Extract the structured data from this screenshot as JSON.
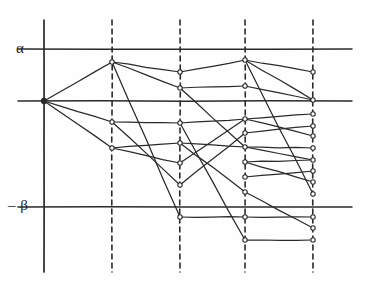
{
  "figure": {
    "kind": "hand-drawn-lattice-diagram",
    "background": "#fefefe",
    "ink_color": "#2a2a2a",
    "width": 368,
    "height": 283
  },
  "axis_labels": {
    "upper": "α",
    "lower": "– β"
  },
  "chart_data": {
    "type": "line",
    "title": "",
    "xlabel": "",
    "ylabel": "",
    "grid": true,
    "legend": "none",
    "xlim": [
      0,
      5
    ],
    "ylim": [
      -2.1,
      1.35
    ],
    "x": [
      0,
      1,
      2,
      3,
      4
    ],
    "x_pixels": [
      44,
      112,
      180,
      245,
      313
    ],
    "reference_lines": [
      {
        "name": "alpha",
        "label": "α",
        "value": 1.0,
        "y_pixel": 49,
        "style": "solid"
      },
      {
        "name": "zero",
        "label": "",
        "value": 0.0,
        "y_pixel": 101,
        "style": "solid"
      },
      {
        "name": "minus-beta",
        "label": "– β",
        "value": -1.0,
        "y_pixel": 207,
        "style": "solid"
      }
    ],
    "vertical_lines": [
      {
        "name": "value-axis",
        "x_pixel": 44,
        "style": "solid",
        "y_from": 20,
        "y_to": 272
      },
      {
        "name": "stage-1",
        "x_pixel": 112,
        "style": "dashed",
        "y_from": 20,
        "y_to": 272
      },
      {
        "name": "stage-2",
        "x_pixel": 180,
        "style": "dashed",
        "y_from": 20,
        "y_to": 272
      },
      {
        "name": "stage-3",
        "x_pixel": 245,
        "style": "dashed",
        "y_from": 20,
        "y_to": 272
      },
      {
        "name": "stage-4",
        "x_pixel": 313,
        "style": "dashed",
        "y_from": 20,
        "y_to": 272
      }
    ],
    "nodes": [
      {
        "id": "r",
        "col": 0,
        "x": 44,
        "y": 101,
        "marker": "filled"
      },
      {
        "id": "a0",
        "col": 1,
        "x": 112,
        "y": 62,
        "marker": "open"
      },
      {
        "id": "a1",
        "col": 1,
        "x": 112,
        "y": 122,
        "marker": "open"
      },
      {
        "id": "a2",
        "col": 1,
        "x": 112,
        "y": 148,
        "marker": "open"
      },
      {
        "id": "b0",
        "col": 2,
        "x": 180,
        "y": 72,
        "marker": "open"
      },
      {
        "id": "b1",
        "col": 2,
        "x": 180,
        "y": 88,
        "marker": "open"
      },
      {
        "id": "b2",
        "col": 2,
        "x": 180,
        "y": 123,
        "marker": "open"
      },
      {
        "id": "b3",
        "col": 2,
        "x": 180,
        "y": 143,
        "marker": "open"
      },
      {
        "id": "b4",
        "col": 2,
        "x": 180,
        "y": 163,
        "marker": "open"
      },
      {
        "id": "b5",
        "col": 2,
        "x": 180,
        "y": 185,
        "marker": "open"
      },
      {
        "id": "b6",
        "col": 2,
        "x": 180,
        "y": 217,
        "marker": "open"
      },
      {
        "id": "c0",
        "col": 3,
        "x": 245,
        "y": 60,
        "marker": "open"
      },
      {
        "id": "c1",
        "col": 3,
        "x": 245,
        "y": 86,
        "marker": "open"
      },
      {
        "id": "c2",
        "col": 3,
        "x": 245,
        "y": 119,
        "marker": "open"
      },
      {
        "id": "c3",
        "col": 3,
        "x": 245,
        "y": 133,
        "marker": "open"
      },
      {
        "id": "c4",
        "col": 3,
        "x": 245,
        "y": 147,
        "marker": "open"
      },
      {
        "id": "c5",
        "col": 3,
        "x": 245,
        "y": 162,
        "marker": "open"
      },
      {
        "id": "c6",
        "col": 3,
        "x": 245,
        "y": 177,
        "marker": "open"
      },
      {
        "id": "c7",
        "col": 3,
        "x": 245,
        "y": 192,
        "marker": "open"
      },
      {
        "id": "c8",
        "col": 3,
        "x": 245,
        "y": 217,
        "marker": "open"
      },
      {
        "id": "c9",
        "col": 3,
        "x": 245,
        "y": 240,
        "marker": "open"
      },
      {
        "id": "d0",
        "col": 4,
        "x": 313,
        "y": 72,
        "marker": "open"
      },
      {
        "id": "d1",
        "col": 4,
        "x": 313,
        "y": 100,
        "marker": "open"
      },
      {
        "id": "d2",
        "col": 4,
        "x": 313,
        "y": 114,
        "marker": "open"
      },
      {
        "id": "d3",
        "col": 4,
        "x": 313,
        "y": 126,
        "marker": "open"
      },
      {
        "id": "d4",
        "col": 4,
        "x": 313,
        "y": 136,
        "marker": "open"
      },
      {
        "id": "d5",
        "col": 4,
        "x": 313,
        "y": 148,
        "marker": "open"
      },
      {
        "id": "d6",
        "col": 4,
        "x": 313,
        "y": 160,
        "marker": "open"
      },
      {
        "id": "d7",
        "col": 4,
        "x": 313,
        "y": 171,
        "marker": "open"
      },
      {
        "id": "d8",
        "col": 4,
        "x": 313,
        "y": 182,
        "marker": "open"
      },
      {
        "id": "d9",
        "col": 4,
        "x": 313,
        "y": 194,
        "marker": "open"
      },
      {
        "id": "d10",
        "col": 4,
        "x": 313,
        "y": 217,
        "marker": "open"
      },
      {
        "id": "d11",
        "col": 4,
        "x": 313,
        "y": 228,
        "marker": "open"
      },
      {
        "id": "d12",
        "col": 4,
        "x": 313,
        "y": 240,
        "marker": "open"
      }
    ],
    "edges": [
      [
        "r",
        "a0"
      ],
      [
        "r",
        "a1"
      ],
      [
        "r",
        "a2"
      ],
      [
        "a0",
        "b0"
      ],
      [
        "a0",
        "b1"
      ],
      [
        "a0",
        "b6"
      ],
      [
        "a1",
        "b2"
      ],
      [
        "a1",
        "b5"
      ],
      [
        "a2",
        "b3"
      ],
      [
        "a2",
        "b4"
      ],
      [
        "b0",
        "c0"
      ],
      [
        "b1",
        "c1"
      ],
      [
        "b1",
        "c4"
      ],
      [
        "b2",
        "c2"
      ],
      [
        "b2",
        "c9"
      ],
      [
        "b3",
        "c4"
      ],
      [
        "b3",
        "c7"
      ],
      [
        "b4",
        "c2"
      ],
      [
        "b5",
        "c3"
      ],
      [
        "b6",
        "c8"
      ],
      [
        "c0",
        "d0"
      ],
      [
        "c0",
        "d1"
      ],
      [
        "c0",
        "d9"
      ],
      [
        "c1",
        "d1"
      ],
      [
        "c2",
        "d2"
      ],
      [
        "c2",
        "d4"
      ],
      [
        "c3",
        "d3"
      ],
      [
        "c4",
        "d5"
      ],
      [
        "c4",
        "d6"
      ],
      [
        "c5",
        "d6"
      ],
      [
        "c5",
        "d8"
      ],
      [
        "c6",
        "d7"
      ],
      [
        "c7",
        "d11"
      ],
      [
        "c8",
        "d10"
      ],
      [
        "c9",
        "d12"
      ]
    ]
  }
}
